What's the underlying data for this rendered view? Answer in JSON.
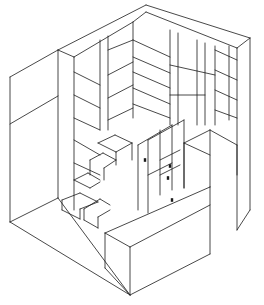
{
  "diagram": {
    "type": "isometric line drawing",
    "colors": {
      "line": "#1a1a1a",
      "background": "#ffffff"
    },
    "width": 264,
    "height": 305,
    "components": [
      "left outer wall panel",
      "back-left shelving wall",
      "back-right shelving wall",
      "right tall cabinet",
      "stepped staircase",
      "drawer cabinet with handles",
      "front low block",
      "floor"
    ],
    "segments": [
      [
        10,
        77,
        58,
        50
      ],
      [
        58,
        50,
        146,
        5
      ],
      [
        146,
        5,
        250,
        38
      ],
      [
        250,
        38,
        237,
        48
      ],
      [
        58,
        50,
        74,
        57
      ],
      [
        74,
        57,
        133,
        22
      ],
      [
        133,
        22,
        146,
        12
      ],
      [
        146,
        12,
        237,
        48
      ],
      [
        10,
        77,
        10,
        222
      ],
      [
        10,
        124,
        58,
        96
      ],
      [
        58,
        50,
        58,
        198
      ],
      [
        10,
        222,
        58,
        198
      ],
      [
        74,
        57,
        74,
        210
      ],
      [
        133,
        22,
        133,
        118
      ],
      [
        237,
        48,
        237,
        230
      ],
      [
        250,
        38,
        250,
        210
      ],
      [
        237,
        230,
        250,
        210
      ],
      [
        100,
        40,
        100,
        130
      ],
      [
        108,
        36,
        108,
        130
      ],
      [
        170,
        30,
        170,
        125
      ],
      [
        178,
        33,
        178,
        125
      ],
      [
        197,
        40,
        197,
        125
      ],
      [
        205,
        43,
        205,
        125
      ],
      [
        215,
        46,
        215,
        125
      ],
      [
        229,
        46,
        229,
        120
      ],
      [
        74,
        72,
        100,
        85
      ],
      [
        74,
        95,
        100,
        108
      ],
      [
        74,
        118,
        100,
        130
      ],
      [
        74,
        140,
        100,
        155
      ],
      [
        74,
        163,
        100,
        175
      ],
      [
        108,
        50,
        133,
        40
      ],
      [
        108,
        75,
        133,
        62
      ],
      [
        108,
        98,
        133,
        85
      ],
      [
        108,
        120,
        133,
        108
      ],
      [
        133,
        40,
        170,
        57
      ],
      [
        133,
        57,
        170,
        73
      ],
      [
        133,
        72,
        170,
        88
      ],
      [
        133,
        88,
        170,
        104
      ],
      [
        133,
        104,
        170,
        118
      ],
      [
        170,
        65,
        215,
        75
      ],
      [
        170,
        95,
        205,
        95
      ],
      [
        215,
        50,
        237,
        60
      ],
      [
        215,
        70,
        237,
        80
      ],
      [
        215,
        90,
        237,
        100
      ],
      [
        215,
        110,
        237,
        118
      ],
      [
        58,
        198,
        130,
        295
      ],
      [
        130,
        295,
        210,
        254
      ],
      [
        10,
        222,
        130,
        295
      ],
      [
        105,
        233,
        210,
        187
      ],
      [
        105,
        233,
        105,
        268
      ],
      [
        105,
        268,
        130,
        295
      ],
      [
        210,
        187,
        210,
        254
      ],
      [
        130,
        247,
        130,
        295
      ],
      [
        105,
        233,
        130,
        247
      ],
      [
        130,
        247,
        210,
        205
      ],
      [
        62,
        200,
        80,
        193
      ],
      [
        80,
        193,
        98,
        202
      ],
      [
        62,
        200,
        62,
        210
      ],
      [
        62,
        210,
        80,
        219
      ],
      [
        80,
        219,
        80,
        209
      ],
      [
        80,
        209,
        98,
        202
      ],
      [
        84,
        209,
        100,
        199
      ],
      [
        100,
        199,
        110,
        205
      ],
      [
        84,
        209,
        84,
        220
      ],
      [
        84,
        220,
        98,
        228
      ],
      [
        98,
        228,
        98,
        217
      ],
      [
        98,
        217,
        110,
        210
      ],
      [
        74,
        180,
        88,
        173
      ],
      [
        88,
        173,
        100,
        180
      ],
      [
        74,
        180,
        90,
        188
      ],
      [
        90,
        188,
        100,
        182
      ],
      [
        90,
        160,
        103,
        153
      ],
      [
        103,
        153,
        116,
        160
      ],
      [
        90,
        160,
        90,
        175
      ],
      [
        104,
        168,
        116,
        160
      ],
      [
        104,
        168,
        104,
        180
      ],
      [
        98,
        143,
        115,
        135
      ],
      [
        115,
        135,
        132,
        143
      ],
      [
        98,
        143,
        116,
        152
      ],
      [
        116,
        152,
        132,
        143
      ],
      [
        116,
        152,
        116,
        165
      ],
      [
        132,
        143,
        132,
        160
      ],
      [
        138,
        145,
        138,
        210
      ],
      [
        148,
        140,
        148,
        213
      ],
      [
        160,
        130,
        160,
        195
      ],
      [
        172,
        125,
        172,
        190
      ],
      [
        184,
        120,
        184,
        188
      ],
      [
        138,
        145,
        172,
        125
      ],
      [
        148,
        140,
        184,
        120
      ],
      [
        160,
        160,
        180,
        150
      ],
      [
        160,
        175,
        180,
        165
      ],
      [
        148,
        175,
        172,
        163
      ],
      [
        184,
        143,
        210,
        130
      ],
      [
        184,
        143,
        184,
        188
      ],
      [
        210,
        130,
        210,
        187
      ],
      [
        184,
        143,
        210,
        155
      ],
      [
        210,
        130,
        237,
        145
      ],
      [
        237,
        145,
        237,
        175
      ]
    ],
    "handles": [
      {
        "label": "cabinet handle",
        "x": 145,
        "y": 160
      },
      {
        "label": "drawer handle",
        "x": 170,
        "y": 166
      },
      {
        "label": "drawer handle",
        "x": 168,
        "y": 178
      },
      {
        "label": "cabinet handle",
        "x": 172,
        "y": 200
      }
    ]
  }
}
